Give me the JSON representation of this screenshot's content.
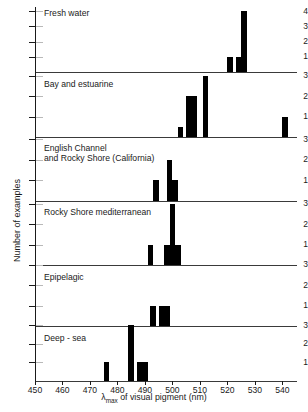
{
  "axes": {
    "x_label_prefix": "λ",
    "x_label_sub": "max",
    "x_label_rest": " of visual pigment (nm)",
    "y_label": "Number of examples",
    "x_ticks": [
      450,
      460,
      470,
      480,
      490,
      500,
      510,
      520,
      530,
      540
    ]
  },
  "chart_data": {
    "type": "bar",
    "title": "",
    "xlabel": "λmax of visual pigment (nm)",
    "ylabel": "Number of examples",
    "xlim": [
      450,
      545
    ],
    "grid": false,
    "legend": "none",
    "bin_width_nm": 2,
    "panels": [
      {
        "name": "Fresh water",
        "ylim": [
          0,
          4
        ],
        "yticks": [
          1,
          2,
          3,
          4
        ],
        "bars": [
          {
            "x": 521,
            "y": 1
          },
          {
            "x": 524,
            "y": 1
          },
          {
            "x": 526,
            "y": 4
          }
        ]
      },
      {
        "name": "Bay and estuarine",
        "ylim": [
          0,
          3
        ],
        "yticks": [
          1,
          2,
          3
        ],
        "bars": [
          {
            "x": 503,
            "y": 0.5
          },
          {
            "x": 506,
            "y": 2
          },
          {
            "x": 508,
            "y": 2
          },
          {
            "x": 512,
            "y": 3
          },
          {
            "x": 541,
            "y": 1
          }
        ]
      },
      {
        "name": "English Channel and Rocky Shore (California)",
        "title_line_1": "English Channel",
        "title_line_2": "and Rocky Shore (California)",
        "ylim": [
          0,
          3
        ],
        "yticks": [
          1,
          2,
          3
        ],
        "bars": [
          {
            "x": 494,
            "y": 1
          },
          {
            "x": 499,
            "y": 2
          },
          {
            "x": 501,
            "y": 1
          }
        ]
      },
      {
        "name": "Rocky Shore mediterranean",
        "ylim": [
          0,
          3
        ],
        "yticks": [
          1,
          2,
          3
        ],
        "bars": [
          {
            "x": 492,
            "y": 1
          },
          {
            "x": 498,
            "y": 1
          },
          {
            "x": 500,
            "y": 3
          },
          {
            "x": 502,
            "y": 1
          }
        ]
      },
      {
        "name": "Epipelagic",
        "ylim": [
          0,
          3
        ],
        "yticks": [
          1,
          2,
          3
        ],
        "bars": [
          {
            "x": 493,
            "y": 1
          },
          {
            "x": 496,
            "y": 1
          },
          {
            "x": 498,
            "y": 1
          }
        ]
      },
      {
        "name": "Deep - sea",
        "ylim": [
          0,
          3
        ],
        "yticks": [
          1,
          2,
          3
        ],
        "bars": [
          {
            "x": 476,
            "y": 1
          },
          {
            "x": 485,
            "y": 3
          },
          {
            "x": 488,
            "y": 1
          },
          {
            "x": 490,
            "y": 1
          }
        ]
      }
    ]
  }
}
